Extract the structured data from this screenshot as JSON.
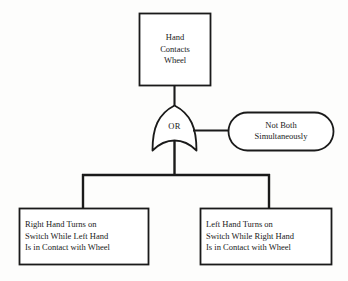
{
  "diagram": {
    "type": "fault-tree",
    "stroke_color": "#1a1a1a",
    "fill_color": "#ffffff",
    "background_color": "#fdfdfc",
    "top_event": {
      "shape": "rectangle",
      "lines": [
        "Hand",
        "Contacts",
        "Wheel"
      ]
    },
    "gate": {
      "shape": "or-gate",
      "label": "OR"
    },
    "constraint": {
      "shape": "stadium",
      "lines": [
        "Not Both",
        "Simultaneously"
      ]
    },
    "basic_events": [
      {
        "shape": "rectangle",
        "position": "left",
        "lines": [
          "Right Hand Turns on",
          "Switch While Left Hand",
          "Is in Contact with Wheel"
        ]
      },
      {
        "shape": "rectangle",
        "position": "right",
        "lines": [
          "Left Hand Turns on",
          "Switch While Right Hand",
          "Is in Contact with Wheel"
        ]
      }
    ]
  }
}
